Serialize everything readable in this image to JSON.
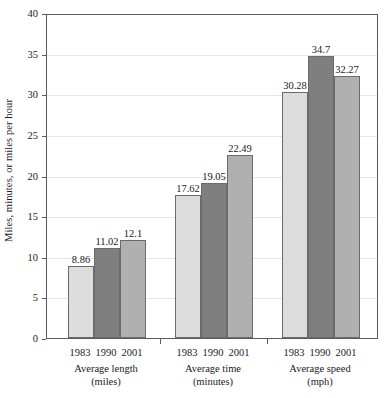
{
  "chart_data": {
    "type": "bar",
    "title": "",
    "xlabel": "",
    "ylabel": "Miles, minutes, or miles per hour",
    "ylim": [
      0,
      40
    ],
    "yticks": [
      0,
      5,
      10,
      15,
      20,
      25,
      30,
      35,
      40
    ],
    "ytick_labels": [
      "0",
      "5",
      "10",
      "15",
      "20",
      "25",
      "30",
      "35",
      "40"
    ],
    "grid": true,
    "legend": "none",
    "categories": [
      "1983",
      "1990",
      "2001"
    ],
    "groups": [
      {
        "name": "Average length",
        "unit": "(miles)",
        "bars": [
          {
            "category": "1983",
            "value": 8.86,
            "label": "8.86",
            "color": "#dcdcdc"
          },
          {
            "category": "1990",
            "value": 11.02,
            "label": "11.02",
            "color": "#7f7f7f"
          },
          {
            "category": "2001",
            "value": 12.1,
            "label": "12.1",
            "color": "#b0b0b0"
          }
        ]
      },
      {
        "name": "Average time",
        "unit": "(minutes)",
        "bars": [
          {
            "category": "1983",
            "value": 17.62,
            "label": "17.62",
            "color": "#dcdcdc"
          },
          {
            "category": "1990",
            "value": 19.05,
            "label": "19.05",
            "color": "#7f7f7f"
          },
          {
            "category": "2001",
            "value": 22.49,
            "label": "22.49",
            "color": "#b0b0b0"
          }
        ]
      },
      {
        "name": "Average speed",
        "unit": "(mph)",
        "bars": [
          {
            "category": "1983",
            "value": 30.28,
            "label": "30.28",
            "color": "#dcdcdc"
          },
          {
            "category": "1990",
            "value": 34.7,
            "label": "34.7",
            "color": "#7f7f7f"
          },
          {
            "category": "2001",
            "value": 32.27,
            "label": "32.27",
            "color": "#b0b0b0"
          }
        ]
      }
    ],
    "series": [
      {
        "name": "1983",
        "values": [
          8.86,
          17.62,
          30.28
        ],
        "color": "#dcdcdc"
      },
      {
        "name": "1990",
        "values": [
          11.02,
          19.05,
          34.7
        ],
        "color": "#7f7f7f"
      },
      {
        "name": "2001",
        "values": [
          12.1,
          22.49,
          32.27
        ],
        "color": "#b0b0b0"
      }
    ],
    "colors": {
      "axis": "#5a5a5a",
      "grid": "#e6e6e6",
      "bar_border": "#6b6b6b",
      "text": "#1a1a1a",
      "background": "#ffffff"
    }
  }
}
